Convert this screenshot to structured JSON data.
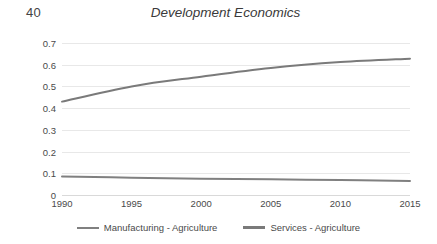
{
  "slide": {
    "number": "40",
    "title": "Development Economics"
  },
  "chart_data": {
    "type": "line",
    "title": "Development Economics",
    "xlabel": "",
    "ylabel": "",
    "x": [
      1990,
      1995,
      2000,
      2005,
      2010,
      2015
    ],
    "xticklabels": [
      "1990",
      "1995",
      "2000",
      "2005",
      "2010",
      "2015"
    ],
    "yticklabels": [
      "0",
      "0.1",
      "0.2",
      "0.3",
      "0.4",
      "0.5",
      "0.6",
      "0.7"
    ],
    "yticks": [
      0,
      0.1,
      0.2,
      0.3,
      0.4,
      0.5,
      0.6,
      0.7
    ],
    "ylim": [
      0,
      0.7
    ],
    "xlim": [
      1990,
      2015
    ],
    "grid": "horizontal",
    "legend_position": "bottom",
    "series": [
      {
        "name": "Manufacturing - Agriculture",
        "color": "#808080",
        "values": [
          0.085,
          0.08,
          0.075,
          0.072,
          0.069,
          0.065
        ]
      },
      {
        "name": "Services - Agriculture",
        "color": "#7a7a7a",
        "values": [
          0.43,
          0.5,
          0.545,
          0.585,
          0.612,
          0.628
        ]
      }
    ]
  },
  "legend": {
    "items": [
      {
        "label": "Manufacturing - Agriculture"
      },
      {
        "label": "Services - Agriculture"
      }
    ]
  },
  "colors": {
    "gridline": "#e8e8e8",
    "text": "#4a4a4a",
    "series_manufacturing": "#808080",
    "series_services": "#7a7a7a"
  }
}
